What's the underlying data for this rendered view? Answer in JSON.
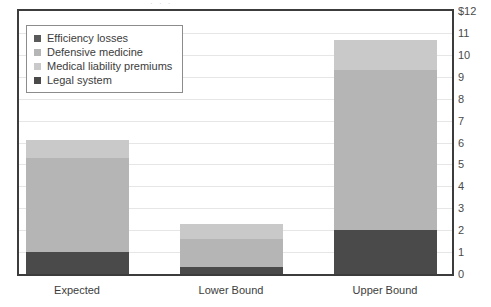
{
  "clipped_top_text": "· · ·",
  "chart_data": {
    "type": "bar",
    "stacked": true,
    "title": "",
    "subtitle": "",
    "xlabel": "",
    "ylabel": "",
    "categories": [
      "Expected",
      "Lower Bound",
      "Upper Bound"
    ],
    "series": [
      {
        "name": "Legal system",
        "color": "#4a4a4a",
        "values": [
          1.0,
          0.3,
          2.0
        ]
      },
      {
        "name": "Medical liability premiums",
        "color": "#b5b5b5",
        "values": [
          4.3,
          1.3,
          7.3
        ]
      },
      {
        "name": "Defensive medicine",
        "color": "#c9c9c9",
        "values": [
          0.8,
          0.7,
          1.4
        ]
      },
      {
        "name": "Efficiency losses",
        "color": "#5a5a5a",
        "values": [
          0.0,
          0.0,
          0.0
        ]
      }
    ],
    "totals": [
      6.1,
      2.3,
      10.7
    ],
    "ylim": [
      0,
      12
    ],
    "ytick_values": [
      0,
      1,
      2,
      3,
      4,
      5,
      6,
      7,
      8,
      9,
      10,
      11,
      12
    ],
    "ytick_labels": [
      "0",
      "1",
      "2",
      "3",
      "4",
      "5",
      "6",
      "7",
      "8",
      "9",
      "10",
      "11",
      "$12"
    ],
    "yaxis_position": "right",
    "grid": true,
    "legend_position": "top-left",
    "legend_entries": [
      {
        "label": "Efficiency losses",
        "color": "#5a5a5a"
      },
      {
        "label": "Defensive medicine",
        "color": "#b5b5b5"
      },
      {
        "label": "Medical liability premiums",
        "color": "#c9c9c9"
      },
      {
        "label": "Legal system",
        "color": "#4a4a4a"
      }
    ]
  },
  "colors": {
    "frame": "#3c3c3c",
    "gridline": "#e6e6e6",
    "background": "#ffffff",
    "text": "#3c3c3c"
  }
}
